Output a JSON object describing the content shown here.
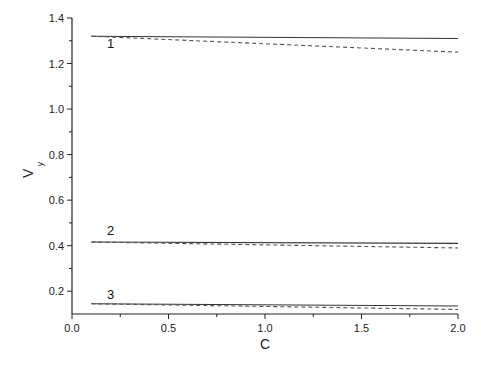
{
  "chart_data": {
    "type": "line",
    "title": "",
    "xlabel": "C",
    "ylabel": "V",
    "ylabel_subscript": "y",
    "xlim": [
      0.0,
      2.0
    ],
    "ylim": [
      0.1,
      1.4
    ],
    "x_major_ticks": [
      0.0,
      0.5,
      1.0,
      1.5,
      2.0
    ],
    "x_tick_labels": [
      "0.0",
      "0.5",
      "1.0",
      "1.5",
      "2.0"
    ],
    "x_minor_ticks": [
      0.25,
      0.75,
      1.25,
      1.75
    ],
    "y_major_ticks": [
      0.2,
      0.4,
      0.6,
      0.8,
      1.0,
      1.2,
      1.4
    ],
    "y_tick_labels": [
      "0.2",
      "0.4",
      "0.6",
      "0.8",
      "1.0",
      "1.2",
      "1.4"
    ],
    "y_minor_ticks": [
      0.3,
      0.5,
      0.7,
      0.9,
      1.1,
      1.3
    ],
    "grid": false,
    "legend": "none",
    "annotations": [
      {
        "text": "1",
        "x": 0.2,
        "y": 1.27
      },
      {
        "text": "2",
        "x": 0.2,
        "y": 0.445
      },
      {
        "text": "3",
        "x": 0.2,
        "y": 0.165
      }
    ],
    "series": [
      {
        "name": "1 (solid)",
        "style": "solid",
        "x": [
          0.1,
          2.0
        ],
        "values": [
          1.32,
          1.31
        ]
      },
      {
        "name": "1 (dashed)",
        "style": "dashed",
        "x": [
          0.1,
          2.0
        ],
        "values": [
          1.32,
          1.25
        ]
      },
      {
        "name": "2 (solid)",
        "style": "solid",
        "x": [
          0.1,
          2.0
        ],
        "values": [
          0.416,
          0.41
        ]
      },
      {
        "name": "2 (dashed)",
        "style": "dashed",
        "x": [
          0.1,
          2.0
        ],
        "values": [
          0.416,
          0.39
        ]
      },
      {
        "name": "3 (solid)",
        "style": "solid",
        "x": [
          0.1,
          2.0
        ],
        "values": [
          0.145,
          0.135
        ]
      },
      {
        "name": "3 (dashed)",
        "style": "dashed",
        "x": [
          0.1,
          2.0
        ],
        "values": [
          0.145,
          0.12
        ]
      }
    ]
  }
}
